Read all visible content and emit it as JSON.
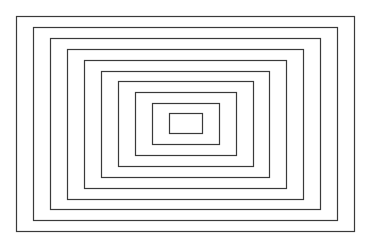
{
  "diagram": {
    "type": "nested-rectangles",
    "count": 10,
    "stroke_color": "#3a3a3a",
    "background": "#ffffff",
    "rectangles": [
      {
        "x": 16,
        "y": 16,
        "w": 338,
        "h": 215
      },
      {
        "x": 33,
        "y": 27,
        "w": 304,
        "h": 193
      },
      {
        "x": 50,
        "y": 38,
        "w": 270,
        "h": 171
      },
      {
        "x": 67,
        "y": 49,
        "w": 236,
        "h": 150
      },
      {
        "x": 84,
        "y": 60,
        "w": 202,
        "h": 128
      },
      {
        "x": 101,
        "y": 71,
        "w": 168,
        "h": 106
      },
      {
        "x": 118,
        "y": 81,
        "w": 135,
        "h": 85
      },
      {
        "x": 135,
        "y": 92,
        "w": 101,
        "h": 63
      },
      {
        "x": 152,
        "y": 103,
        "w": 67,
        "h": 41
      },
      {
        "x": 169,
        "y": 113,
        "w": 33,
        "h": 20
      }
    ]
  }
}
